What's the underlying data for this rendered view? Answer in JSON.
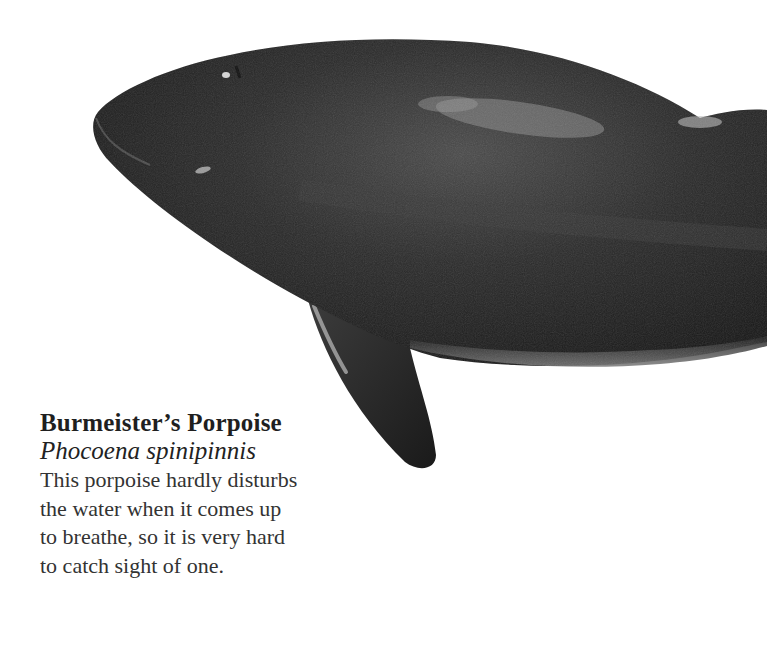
{
  "illustration": {
    "subject": "porpoise-illustration",
    "colors": {
      "background": "#ffffff",
      "body_dark": "#1c1c1c",
      "body_mid": "#3a3a3a",
      "highlight": "#9a9a9a",
      "belly": "#6e6e6e"
    }
  },
  "caption": {
    "title": "Burmeister’s Porpoise",
    "latin_name": "Phocoena spinipinnis",
    "lines": [
      "This porpoise hardly disturbs",
      "the water when it comes up",
      "to breathe, so it is very hard",
      "to catch sight of one."
    ]
  }
}
